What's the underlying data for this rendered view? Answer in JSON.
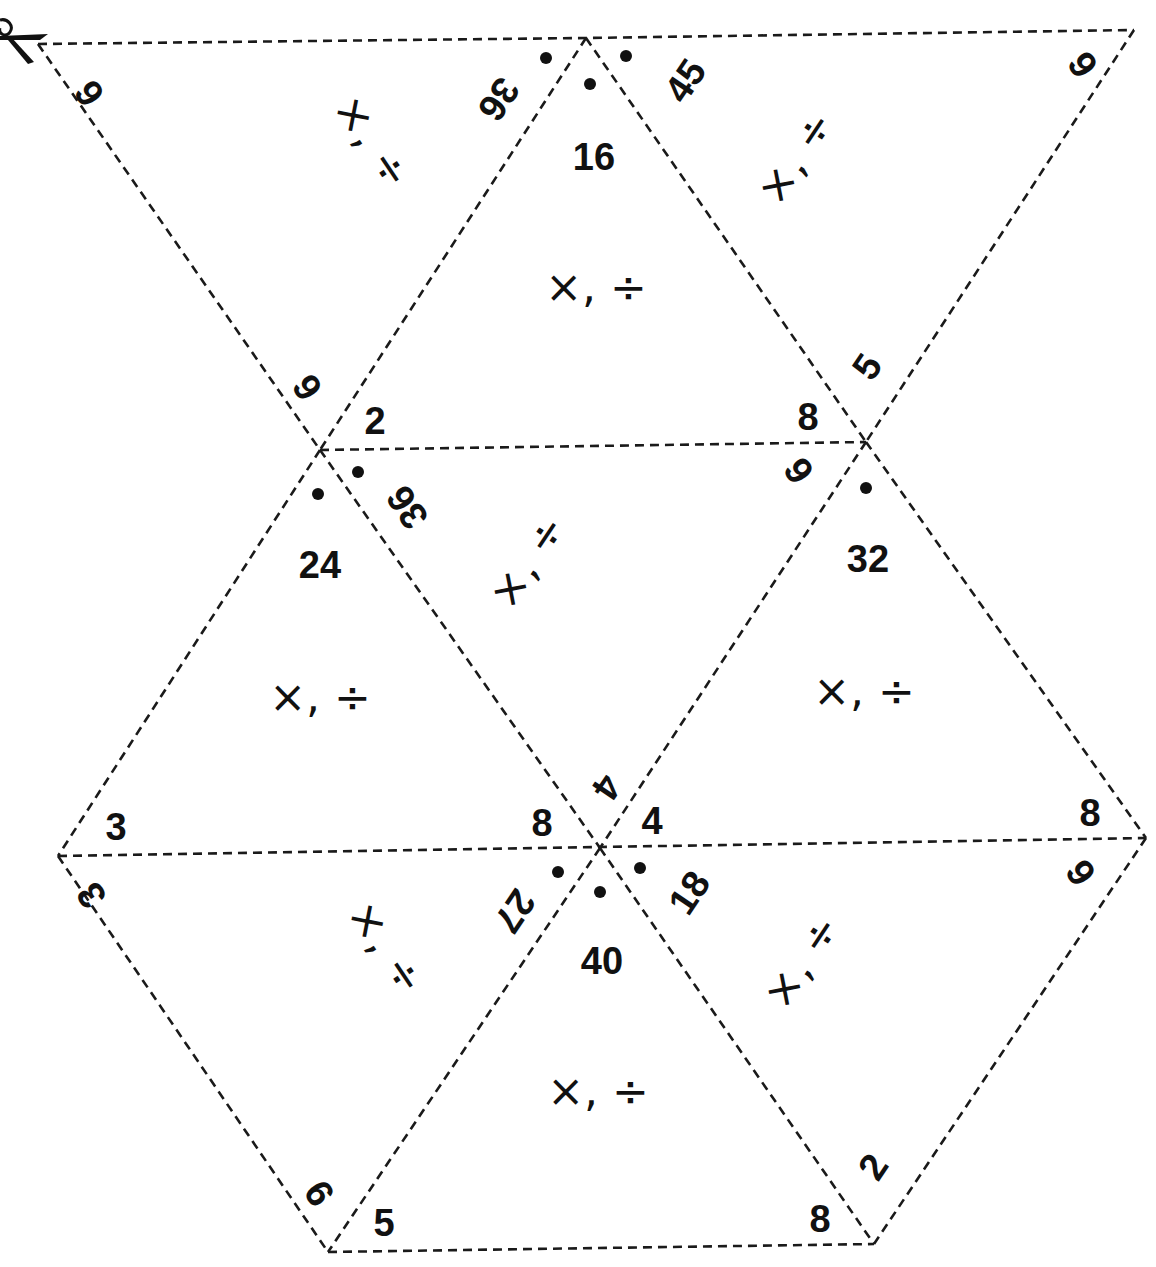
{
  "worksheet": {
    "type": "tarsia-triangle-puzzle",
    "operation_label": "×, ÷",
    "colors": {
      "ink": "#111111",
      "paper": "#ffffff",
      "cut_line": "#1a1a1a"
    },
    "cut_icon": "scissors-icon",
    "triangles": [
      {
        "id": "row1-left",
        "orientation": "down",
        "edges": {
          "top": "36",
          "left": "6",
          "right": "6"
        },
        "operation": "×, ÷"
      },
      {
        "id": "row1-middle",
        "orientation": "up",
        "center": "16",
        "edges": {
          "bottom-left": "2",
          "bottom-right": "8"
        },
        "operation": "×, ÷"
      },
      {
        "id": "row1-right",
        "orientation": "down",
        "edges": {
          "top-left": "45",
          "top-right": "9",
          "bottom": "5"
        },
        "operation": "×, ÷"
      },
      {
        "id": "row2-left",
        "orientation": "up",
        "center": "24",
        "edges": {
          "bottom-left": "3",
          "bottom-right": "8"
        },
        "operation": "×, ÷"
      },
      {
        "id": "row2-middle",
        "orientation": "down",
        "edges": {
          "top-left": "36",
          "top-right": "9",
          "bottom": "4"
        },
        "operation": "×, ÷"
      },
      {
        "id": "row2-right",
        "orientation": "up",
        "center": "32",
        "edges": {
          "bottom-left": "4",
          "bottom-right": "8"
        },
        "operation": "×, ÷"
      },
      {
        "id": "row3-left",
        "orientation": "down",
        "edges": {
          "top-left": "3",
          "top-right": "27",
          "bottom": "9"
        },
        "operation": "×, ÷"
      },
      {
        "id": "row3-middle",
        "orientation": "up",
        "center": "40",
        "edges": {
          "bottom-left": "5",
          "bottom-right": "8"
        },
        "operation": "×, ÷"
      },
      {
        "id": "row3-right",
        "orientation": "down",
        "edges": {
          "top-left": "18",
          "top-right": "9",
          "bottom": "2"
        },
        "operation": "×, ÷"
      }
    ],
    "labels": {
      "t1_top": "36",
      "t1_left": "6",
      "t1_bottom": "6",
      "t2_center": "16",
      "t2_bl": "2",
      "t2_br": "8",
      "t3_tl": "45",
      "t3_tr": "9",
      "t3_bottom": "5",
      "t4_center": "24",
      "t4_bl": "3",
      "t4_br": "8",
      "t5_tl": "36",
      "t5_tr": "9",
      "t5_bottom": "4",
      "t6_center": "32",
      "t6_bl": "4",
      "t6_br": "8",
      "t7_tl": "3",
      "t7_tr": "27",
      "t7_bottom": "9",
      "t8_center": "40",
      "t8_bl": "5",
      "t8_br": "8",
      "t9_tl": "18",
      "t9_tr": "9",
      "t9_bottom": "2",
      "op": "×, ÷"
    }
  }
}
